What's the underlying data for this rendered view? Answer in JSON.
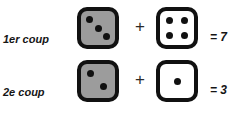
{
  "figure": {
    "background_color": "#ffffff",
    "ink_color": "#111111",
    "gray_die_color": "#9c9c9c",
    "white_die_color": "#ffffff"
  },
  "rows": [
    {
      "label": "1er coup",
      "gray_die": {
        "value": 3,
        "face": "three",
        "color": "gray"
      },
      "operator": "+",
      "white_die": {
        "value": 4,
        "face": "four",
        "color": "white"
      },
      "result": "= 7",
      "sum": 7
    },
    {
      "label": "2e coup",
      "gray_die": {
        "value": 2,
        "face": "two",
        "color": "gray"
      },
      "operator": "+",
      "white_die": {
        "value": 1,
        "face": "one",
        "color": "white"
      },
      "result": "= 3",
      "sum": 3
    }
  ]
}
